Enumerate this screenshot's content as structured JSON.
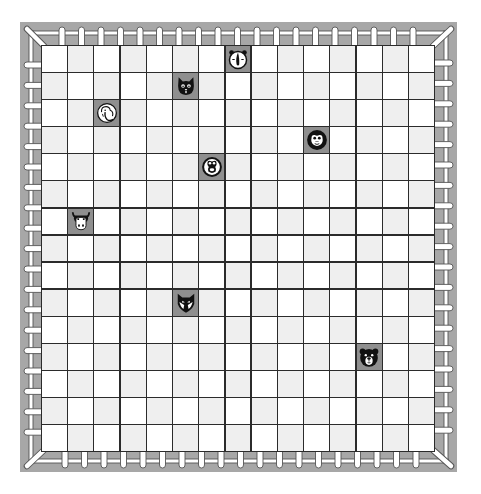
{
  "board": {
    "rows": 15,
    "cols": 15,
    "colors": {
      "frame": "#a7a7a7",
      "light_cell": "#ffffff",
      "dark_cell": "#efefef",
      "grid_line": "#2b2b2b",
      "piece_bg": "#8f8f8f",
      "fence": "#ffffff",
      "fence_outline": "#555555"
    }
  },
  "fence": {
    "pickets_per_side": 19
  },
  "pieces": [
    {
      "animal": "dog",
      "icon": "dog-icon",
      "row": 0,
      "col": 7
    },
    {
      "animal": "cat",
      "icon": "cat-icon",
      "row": 1,
      "col": 5
    },
    {
      "animal": "elephant",
      "icon": "elephant-icon",
      "row": 2,
      "col": 2
    },
    {
      "animal": "monkey",
      "icon": "monkey-icon",
      "row": 3,
      "col": 10
    },
    {
      "animal": "frog",
      "icon": "frog-icon",
      "row": 4,
      "col": 6
    },
    {
      "animal": "cow",
      "icon": "cow-icon",
      "row": 6,
      "col": 1
    },
    {
      "animal": "fox",
      "icon": "fox-icon",
      "row": 9,
      "col": 5
    },
    {
      "animal": "bear",
      "icon": "bear-icon",
      "row": 11,
      "col": 12
    }
  ]
}
